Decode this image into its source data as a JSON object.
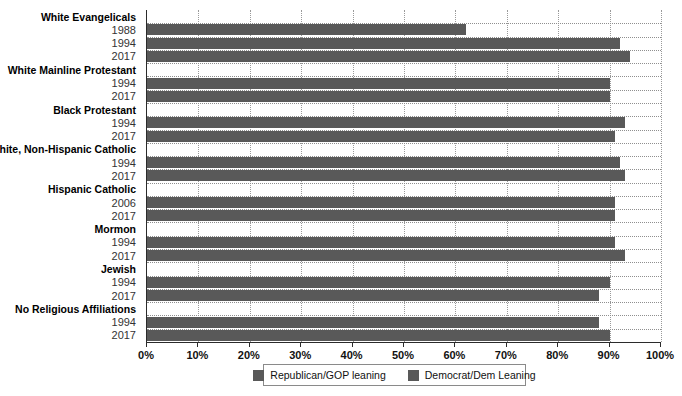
{
  "chart_data": {
    "type": "bar",
    "orientation": "horizontal",
    "title": "",
    "xlabel": "",
    "ylabel": "",
    "xlim": [
      0,
      100
    ],
    "xtick_labels": [
      "0%",
      "10%",
      "20%",
      "30%",
      "40%",
      "50%",
      "60%",
      "70%",
      "80%",
      "90%",
      "100%"
    ],
    "xtick_values": [
      0,
      10,
      20,
      30,
      40,
      50,
      60,
      70,
      80,
      90,
      100
    ],
    "grid": "vertical-dotted",
    "legend_position": "bottom-center",
    "series": [
      {
        "name": "Republican/GOP leaning",
        "color": "#595959"
      },
      {
        "name": "Democrat/Dem Leaning",
        "color": "#595959"
      }
    ],
    "groups": [
      {
        "label": "White Evangelicals",
        "series": "Republican/GOP leaning",
        "rows": [
          {
            "year": "1988",
            "value": 62
          },
          {
            "year": "1994",
            "value": 92
          },
          {
            "year": "2017",
            "value": 94
          }
        ]
      },
      {
        "label": "White Mainline Protestant",
        "series": "Republican/GOP leaning",
        "rows": [
          {
            "year": "1994",
            "value": 90
          },
          {
            "year": "2017",
            "value": 90
          }
        ]
      },
      {
        "label": "Black Protestant",
        "series": "Democrat/Dem Leaning",
        "rows": [
          {
            "year": "1994",
            "value": 93
          },
          {
            "year": "2017",
            "value": 91
          }
        ]
      },
      {
        "label": "White, Non-Hispanic Catholic",
        "series": "Republican/GOP leaning",
        "rows": [
          {
            "year": "1994",
            "value": 92
          },
          {
            "year": "2017",
            "value": 93
          }
        ]
      },
      {
        "label": "Hispanic Catholic",
        "series": "Democrat/Dem Leaning",
        "rows": [
          {
            "year": "2006",
            "value": 91
          },
          {
            "year": "2017",
            "value": 91
          }
        ]
      },
      {
        "label": "Mormon",
        "series": "Republican/GOP leaning",
        "rows": [
          {
            "year": "1994",
            "value": 91
          },
          {
            "year": "2017",
            "value": 93
          }
        ]
      },
      {
        "label": "Jewish",
        "series": "Democrat/Dem Leaning",
        "rows": [
          {
            "year": "1994",
            "value": 90
          },
          {
            "year": "2017",
            "value": 88
          }
        ]
      },
      {
        "label": "No Religious Affiliations",
        "series": "Democrat/Dem Leaning",
        "rows": [
          {
            "year": "1994",
            "value": 88
          },
          {
            "year": "2017",
            "value": 90
          }
        ]
      }
    ]
  },
  "legend": {
    "items": [
      {
        "label": "Republican/GOP leaning",
        "color": "#595959"
      },
      {
        "label": "Democrat/Dem Leaning",
        "color": "#595959"
      }
    ]
  }
}
